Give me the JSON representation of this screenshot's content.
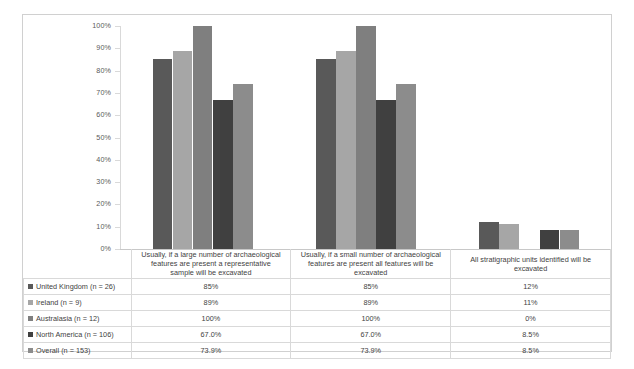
{
  "chart_data": {
    "type": "bar",
    "title": "",
    "xlabel": "",
    "ylabel": "",
    "ylim": [
      0,
      100
    ],
    "ytick_labels": [
      "100%",
      "90%",
      "80%",
      "70%",
      "60%",
      "50%",
      "40%",
      "30%",
      "20%",
      "10%",
      "0%"
    ],
    "ytick_values": [
      100,
      90,
      80,
      70,
      60,
      50,
      40,
      30,
      20,
      10,
      0
    ],
    "grid": false,
    "legend_position": "table-left-column",
    "categories": [
      "Usually, if a large number of archaeological features are present a representative sample will be excavated",
      "Usually, if a small number of archaeological features are present all features will be excavated",
      "All stratigraphic units identified will be excavated"
    ],
    "series": [
      {
        "name": "United Kingdom (n = 26)",
        "color": "#595959",
        "values": [
          85,
          85,
          12
        ],
        "labels": [
          "85%",
          "85%",
          "12%"
        ]
      },
      {
        "name": "Ireland (n = 9)",
        "color": "#a6a6a6",
        "values": [
          89,
          89,
          11
        ],
        "labels": [
          "89%",
          "89%",
          "11%"
        ]
      },
      {
        "name": "Australasia (n = 12)",
        "color": "#7f7f7f",
        "values": [
          100,
          100,
          0
        ],
        "labels": [
          "100%",
          "100%",
          "0%"
        ]
      },
      {
        "name": "North America (n = 106)",
        "color": "#404040",
        "values": [
          67.0,
          67.0,
          8.5
        ],
        "labels": [
          "67.0%",
          "67.0%",
          "8.5%"
        ]
      },
      {
        "name": "Overall (n = 153)",
        "color": "#8c8c8c",
        "values": [
          73.9,
          73.9,
          8.5
        ],
        "labels": [
          "73.9%",
          "73.9%",
          "8.5%"
        ]
      }
    ]
  }
}
